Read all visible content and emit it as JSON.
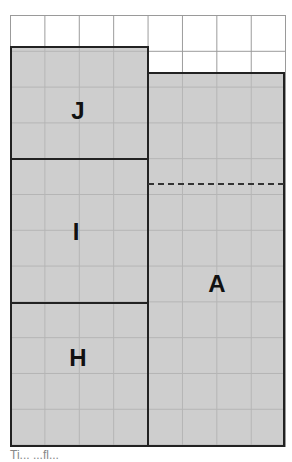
{
  "diagram": {
    "grid": {
      "columns": 8,
      "rows": 12
    },
    "blocks": [
      {
        "id": "J",
        "label": "J"
      },
      {
        "id": "I",
        "label": "I"
      },
      {
        "id": "H",
        "label": "H"
      },
      {
        "id": "A",
        "label": "A"
      }
    ],
    "colors": {
      "block_fill": "#c4c4c4",
      "border": "#222222",
      "grid_line": "#9a9a9a"
    },
    "footer_text": "Ti...      ...fl..."
  }
}
